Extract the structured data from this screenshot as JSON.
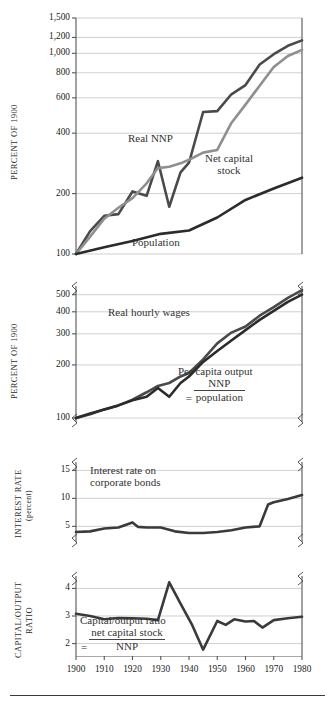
{
  "figure": {
    "bottom_rule": true,
    "colors": {
      "series_dark": "#2b2b2b",
      "series_medium": "#565656",
      "series_light": "#8f8f8f",
      "grid": "#bbbbbb",
      "axis": "#555555",
      "text": "#1a1a1a"
    },
    "x_axis": {
      "label": "",
      "ticks": [
        1900,
        1910,
        1920,
        1930,
        1940,
        1950,
        1960,
        1970,
        1980
      ],
      "tick_labels": [
        "1900",
        "1910",
        "1920",
        "1930",
        "1940",
        "1950",
        "1960",
        "1970",
        "1980"
      ],
      "range": [
        1900,
        1980
      ]
    }
  },
  "chart_data": [
    {
      "id": "panel-percent-of-1900-top",
      "type": "line",
      "title": "",
      "ylabel": "PERCENT OF 1900",
      "xlabel": "",
      "scale": "log",
      "ylim": [
        100,
        1500
      ],
      "yticks": [
        100,
        200,
        400,
        600,
        800,
        1000,
        1200,
        1500
      ],
      "ytick_labels": [
        "100",
        "200",
        "400",
        "600",
        "800",
        "1,000",
        "1,200",
        "1,500"
      ],
      "grid": true,
      "axis_break_bottom": false,
      "axis_break_top": false,
      "annotations": [
        {
          "text": "Real NNP",
          "x": 1932,
          "y": 430
        },
        {
          "text": "Net capital stock",
          "x": 1952,
          "y": 370
        },
        {
          "text": "Population",
          "x": 1938,
          "y": 128
        }
      ],
      "series": [
        {
          "name": "Real NNP",
          "color": "#4a4a4a",
          "x": [
            1900,
            1905,
            1910,
            1915,
            1920,
            1925,
            1929,
            1933,
            1937,
            1940,
            1945,
            1950,
            1955,
            1960,
            1965,
            1970,
            1975,
            1980
          ],
          "values": [
            100,
            130,
            155,
            158,
            205,
            195,
            290,
            172,
            255,
            285,
            510,
            515,
            625,
            695,
            880,
            990,
            1090,
            1160
          ]
        },
        {
          "name": "Net capital stock",
          "color": "#8f8f8f",
          "x": [
            1900,
            1905,
            1910,
            1915,
            1920,
            1925,
            1929,
            1933,
            1937,
            1940,
            1945,
            1950,
            1955,
            1960,
            1965,
            1970,
            1975,
            1980
          ],
          "values": [
            100,
            122,
            150,
            170,
            190,
            225,
            268,
            272,
            283,
            295,
            320,
            330,
            450,
            555,
            690,
            855,
            970,
            1040
          ]
        },
        {
          "name": "Population",
          "color": "#2b2b2b",
          "x": [
            1900,
            1910,
            1920,
            1930,
            1940,
            1950,
            1960,
            1970,
            1980
          ],
          "values": [
            100,
            108,
            116,
            126,
            131,
            152,
            186,
            212,
            240
          ]
        }
      ]
    },
    {
      "id": "panel-percent-of-1900-bottom",
      "type": "line",
      "title": "",
      "ylabel": "PERCENT OF 1900",
      "xlabel": "",
      "scale": "log",
      "ylim": [
        95,
        560
      ],
      "yticks": [
        100,
        200,
        300,
        400,
        500
      ],
      "ytick_labels": [
        "100",
        "200",
        "300",
        "400",
        "500"
      ],
      "grid": true,
      "axis_break_top": true,
      "axis_break_bottom": true,
      "annotations": [
        {
          "text": "Real hourly wages",
          "x": 1930,
          "y": 355
        },
        {
          "text": "Per capita output = NNP / population",
          "x": 1952,
          "y": 165
        }
      ],
      "series": [
        {
          "name": "Real hourly wages",
          "color": "#4a4a4a",
          "x": [
            1900,
            1905,
            1910,
            1915,
            1920,
            1925,
            1929,
            1933,
            1937,
            1940,
            1945,
            1950,
            1955,
            1960,
            1965,
            1970,
            1975,
            1980
          ],
          "values": [
            100,
            105,
            112,
            118,
            127,
            140,
            152,
            158,
            172,
            180,
            215,
            265,
            305,
            330,
            380,
            425,
            480,
            530
          ]
        },
        {
          "name": "Per capita output = NNP / population",
          "color": "#2b2b2b",
          "x": [
            1900,
            1905,
            1910,
            1915,
            1920,
            1925,
            1929,
            1933,
            1937,
            1940,
            1945,
            1950,
            1955,
            1960,
            1965,
            1970,
            1975,
            1980
          ],
          "values": [
            100,
            106,
            112,
            118,
            126,
            132,
            148,
            132,
            158,
            172,
            208,
            240,
            275,
            315,
            360,
            405,
            455,
            500
          ]
        }
      ]
    },
    {
      "id": "panel-interest-rate",
      "type": "line",
      "title": "",
      "ylabel": "INTEREST RATE (percent)",
      "ylabel_line1": "INTEREST RATE",
      "ylabel_line2": "(percent)",
      "xlabel": "",
      "scale": "linear",
      "ylim": [
        2.2,
        16.5
      ],
      "yticks": [
        5,
        10,
        15
      ],
      "ytick_labels": [
        "5",
        "10",
        "15"
      ],
      "grid": true,
      "axis_break_top": true,
      "axis_break_bottom": true,
      "annotations": [
        {
          "text": "Interest rate on corporate bonds",
          "x": 1912,
          "y": 11.5
        }
      ],
      "series": [
        {
          "name": "Interest rate on corporate bonds",
          "color": "#3a3a3a",
          "x": [
            1900,
            1905,
            1910,
            1915,
            1920,
            1922,
            1925,
            1930,
            1935,
            1940,
            1945,
            1950,
            1955,
            1960,
            1965,
            1968,
            1970,
            1975,
            1980
          ],
          "values": [
            4.0,
            4.1,
            4.6,
            4.8,
            5.7,
            4.9,
            4.8,
            4.8,
            4.1,
            3.8,
            3.8,
            4.0,
            4.3,
            4.8,
            5.0,
            8.9,
            9.3,
            9.9,
            10.6
          ]
        }
      ]
    },
    {
      "id": "panel-capital-output-ratio",
      "type": "line",
      "title": "",
      "ylabel": "CAPITAL/OUTPUT RATIO",
      "ylabel_line1": "CAPITAL/OUTPUT",
      "ylabel_line2": "RATIO",
      "xlabel": "",
      "scale": "linear",
      "ylim": [
        1.55,
        4.45
      ],
      "yticks": [
        2,
        3,
        4
      ],
      "ytick_labels": [
        "2",
        "3",
        "4"
      ],
      "grid": true,
      "axis_break_top": true,
      "axis_break_bottom": false,
      "annotations": [
        {
          "text": "Capital/output ratio = net capital stock / NNP",
          "x": 1922,
          "y": 2.35
        }
      ],
      "series": [
        {
          "name": "Capital/output ratio = net capital stock / NNP",
          "color": "#3a3a3a",
          "x": [
            1900,
            1905,
            1910,
            1915,
            1920,
            1925,
            1929,
            1933,
            1937,
            1941,
            1945,
            1950,
            1953,
            1956,
            1960,
            1963,
            1966,
            1970,
            1975,
            1980
          ],
          "values": [
            3.08,
            3.0,
            2.88,
            2.93,
            2.92,
            2.9,
            2.85,
            4.22,
            3.45,
            2.7,
            1.78,
            2.82,
            2.68,
            2.88,
            2.8,
            2.82,
            2.58,
            2.85,
            2.92,
            2.97
          ]
        }
      ]
    }
  ],
  "annotation_text": {
    "real_nnp": "Real NNP",
    "net_capital_stock_l1": "Net capital",
    "net_capital_stock_l2": "stock",
    "population": "Population",
    "real_hourly_wages": "Real hourly wages",
    "per_capita_l1": "Per capita  output",
    "per_capita_eq": "=",
    "per_capita_num": "NNP",
    "per_capita_den": "population",
    "interest_rate_l1": "Interest rate on",
    "interest_rate_l2": "corporate bonds",
    "capital_output_l1": "Capital/output ratio",
    "capital_output_eq": "=",
    "capital_output_num": "net capital stock",
    "capital_output_den": "NNP"
  },
  "axis_titles": {
    "panel1": "PERCENT OF 1900",
    "panel2": "PERCENT OF 1900",
    "panel3_l1": "INTEREST RATE",
    "panel3_l2": "(percent)",
    "panel4_l1": "CAPITAL/OUTPUT",
    "panel4_l2": "RATIO"
  }
}
